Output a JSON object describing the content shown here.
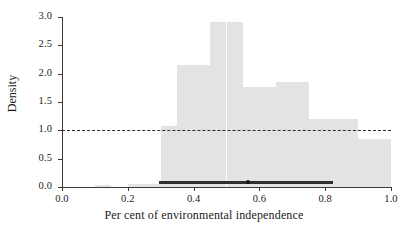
{
  "chart_data": {
    "type": "bar",
    "title": "",
    "subtitle": "",
    "xlabel": "Per cent of environmental independence",
    "ylabel": "Density",
    "xlim": [
      0.0,
      1.0
    ],
    "ylim": [
      0.0,
      3.0
    ],
    "xticks": [
      "0.0",
      "0.2",
      "0.4",
      "0.6",
      "0.8",
      "1.0"
    ],
    "xtick_values": [
      0.0,
      0.2,
      0.4,
      0.6,
      0.8,
      1.0
    ],
    "yticks": [
      "0.0",
      "0.5",
      "1.0",
      "1.5",
      "2.0",
      "2.5",
      "3.0"
    ],
    "ytick_values": [
      0.0,
      0.5,
      1.0,
      1.5,
      2.0,
      2.5,
      3.0
    ],
    "grid": false,
    "legend": null,
    "bin_width": 0.05,
    "bin_starts": [
      0.1,
      0.15,
      0.2,
      0.25,
      0.3,
      0.35,
      0.4,
      0.45,
      0.5,
      0.55,
      0.6,
      0.65,
      0.7,
      0.75,
      0.8,
      0.85,
      0.9,
      0.95
    ],
    "categories": [
      "0.10-0.15",
      "0.15-0.20",
      "0.20-0.25",
      "0.25-0.30",
      "0.30-0.35",
      "0.35-0.40",
      "0.40-0.45",
      "0.45-0.50",
      "0.50-0.55",
      "0.55-0.60",
      "0.60-0.65",
      "0.65-0.70",
      "0.70-0.75",
      "0.75-0.80",
      "0.80-0.85",
      "0.85-0.90",
      "0.90-0.95",
      "0.95-1.00"
    ],
    "values": [
      0.03,
      0.0,
      0.05,
      0.05,
      1.08,
      1.08,
      2.15,
      2.15,
      2.92,
      2.92,
      1.77,
      1.77,
      1.85,
      1.85,
      1.2,
      1.2,
      0.85,
      0.85
    ],
    "bars": [
      {
        "x0": 0.1,
        "x1": 0.15,
        "height": 0.03
      },
      {
        "x0": 0.2,
        "x1": 0.3,
        "height": 0.05
      },
      {
        "x0": 0.3,
        "x1": 0.35,
        "height": 1.08
      },
      {
        "x0": 0.35,
        "x1": 0.4,
        "height": 2.15
      },
      {
        "x0": 0.4,
        "x1": 0.45,
        "height": 2.15
      },
      {
        "x0": 0.45,
        "x1": 0.5,
        "height": 2.92
      },
      {
        "x0": 0.5,
        "x1": 0.55,
        "height": 2.92
      },
      {
        "x0": 0.55,
        "x1": 0.6,
        "height": 1.77
      },
      {
        "x0": 0.6,
        "x1": 0.65,
        "height": 1.77
      },
      {
        "x0": 0.65,
        "x1": 0.7,
        "height": 1.85
      },
      {
        "x0": 0.7,
        "x1": 0.75,
        "height": 1.85
      },
      {
        "x0": 0.75,
        "x1": 0.8,
        "height": 1.2
      },
      {
        "x0": 0.8,
        "x1": 0.85,
        "height": 1.2
      },
      {
        "x0": 0.85,
        "x1": 0.9,
        "height": 1.2
      },
      {
        "x0": 0.9,
        "x1": 0.95,
        "height": 0.85
      },
      {
        "x0": 0.95,
        "x1": 1.0,
        "height": 0.85
      }
    ],
    "reference_line": {
      "orientation": "horizontal",
      "y": 1.0,
      "style": "dashed",
      "color": "#2a2a2a"
    },
    "interval": {
      "low": 0.295,
      "high": 0.825,
      "point": 0.565,
      "y": 0.0,
      "color": "#2f2f2f"
    },
    "colors": {
      "bar_fill": "#e3e3e3",
      "axis": "#3a3a3a",
      "reference": "#2a2a2a",
      "interval": "#2f2f2f",
      "background": "#ffffff"
    }
  }
}
